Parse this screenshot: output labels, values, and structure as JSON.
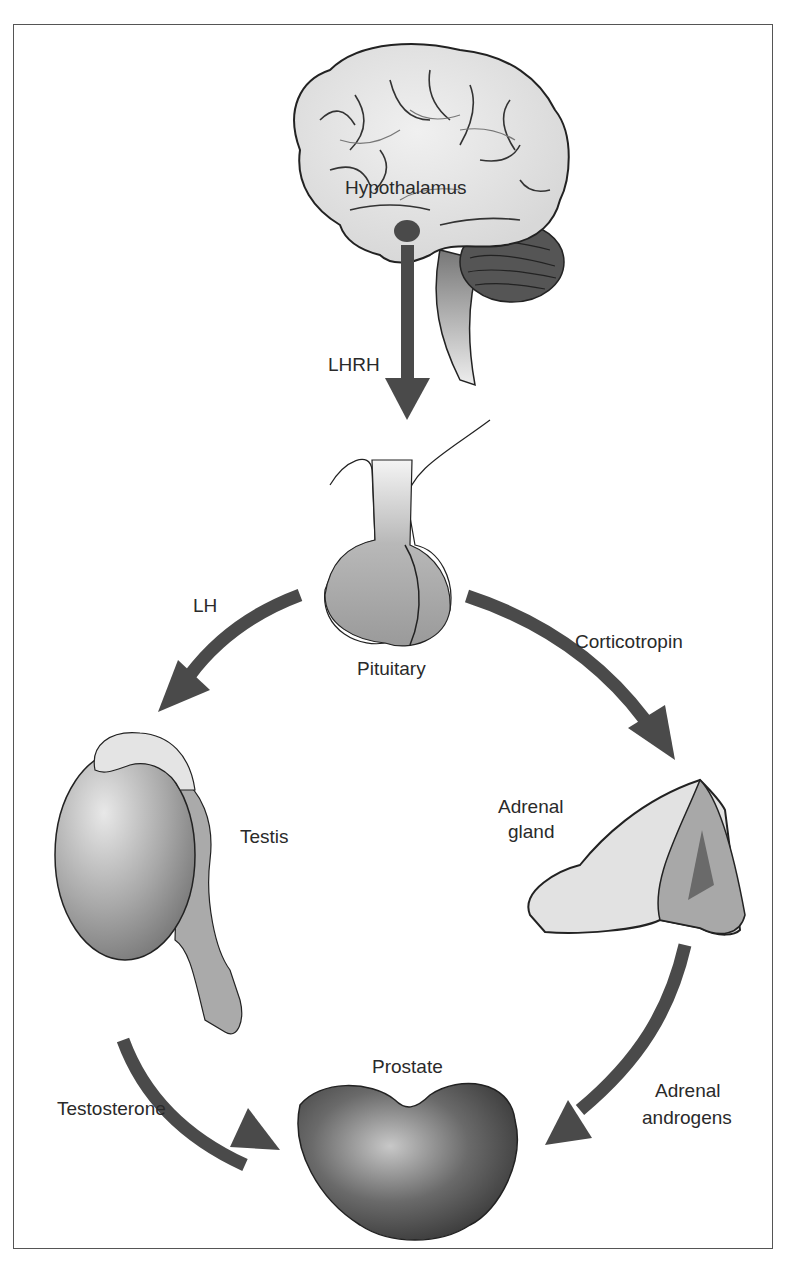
{
  "diagram": {
    "type": "hormone-pathway",
    "colors": {
      "arrow": "#4a4a4a",
      "frame": "#555555",
      "organ_light": "#e0e0e0",
      "organ_mid": "#a8a8a8",
      "organ_dark": "#555555"
    },
    "nodes": {
      "hypothalamus": "Hypothalamus",
      "pituitary": "Pituitary",
      "testis": "Testis",
      "adrenal_line1": "Adrenal",
      "adrenal_line2": "gland",
      "prostate": "Prostate"
    },
    "edges": {
      "lhrh": "LHRH",
      "lh": "LH",
      "corticotropin": "Corticotropin",
      "testosterone": "Testosterone",
      "adrenal_androgens_line1": "Adrenal",
      "adrenal_androgens_line2": "androgens"
    },
    "flow": [
      {
        "from": "Hypothalamus",
        "to": "Pituitary",
        "label": "LHRH"
      },
      {
        "from": "Pituitary",
        "to": "Testis",
        "label": "LH"
      },
      {
        "from": "Pituitary",
        "to": "Adrenal gland",
        "label": "Corticotropin"
      },
      {
        "from": "Testis",
        "to": "Prostate",
        "label": "Testosterone"
      },
      {
        "from": "Adrenal gland",
        "to": "Prostate",
        "label": "Adrenal androgens"
      }
    ]
  }
}
